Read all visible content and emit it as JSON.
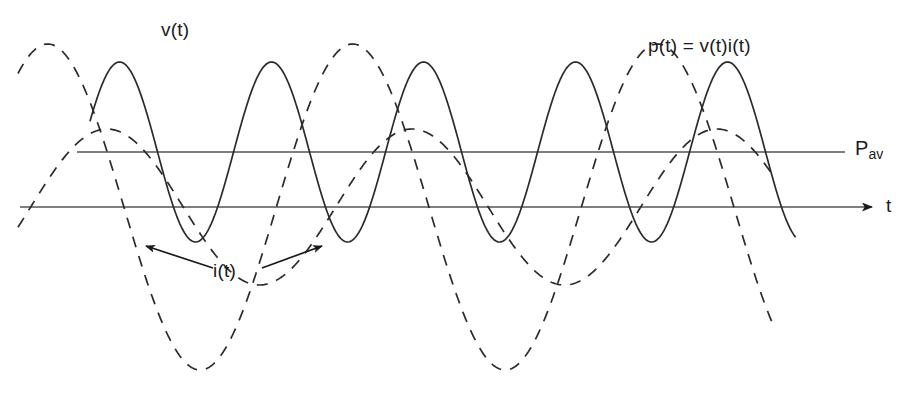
{
  "figure": {
    "title": "",
    "background_color": "#ffffff",
    "curve_color": "#2b2b2b",
    "axis_color": "#555555",
    "text_color": "#1a1a1a",
    "width": 912,
    "height": 394
  },
  "labels": {
    "voltage": "v(t)",
    "power": "p(t) = v(t)i(t)",
    "current": "i(t)",
    "time_axis": "t",
    "average_power_base": "P",
    "average_power_sub": "av"
  },
  "chart_data": {
    "type": "line",
    "title": "",
    "xlabel": "t",
    "ylabel": "",
    "grid": false,
    "legend": "annotations",
    "axes": {
      "time_axis_label": "t",
      "time_axis_y_px": 207,
      "time_axis_x_start_px": 20,
      "time_axis_x_end_px": 878,
      "time_axis_has_arrow": true,
      "pav_line_label": "Pav",
      "pav_line_y_px": 152,
      "pav_line_x_start_px": 77,
      "pav_line_x_end_px": 845
    },
    "annotations": [
      {
        "text": "v(t)",
        "x_px": 178,
        "y_px": 30,
        "points_to": "dashed-voltage-curve"
      },
      {
        "text": "p(t) = v(t)i(t)",
        "x_px": 707,
        "y_px": 47,
        "points_to": "solid-power-curve"
      },
      {
        "text": "i(t)",
        "x_px": 228,
        "y_px": 272,
        "points_to": "dashed-current-curve"
      },
      {
        "text": "t",
        "x_px": 890,
        "y_px": 205,
        "points_to": "time-axis"
      },
      {
        "text": "Pav",
        "x_px": 866,
        "y_px": 148,
        "points_to": "average-power-line"
      }
    ],
    "leader_arrows": [
      {
        "from_x_px": 213,
        "from_y_px": 268,
        "to_x_px": 141,
        "to_y_px": 243
      },
      {
        "from_x_px": 262,
        "from_y_px": 268,
        "to_x_px": 327,
        "to_y_px": 243
      }
    ],
    "series": [
      {
        "name": "v(t)",
        "style": "dashed",
        "description": "Sinusoidal voltage waveform, large amplitude, zero-mean about the t axis",
        "amplitude_px": 163,
        "baseline_y_px": 207,
        "period_px": 305,
        "phase_deg": 55,
        "x_start_px": 18,
        "x_end_px": 772
      },
      {
        "name": "i(t)",
        "style": "dashed",
        "description": "Sinusoidal current waveform, smaller amplitude, lagging the voltage, zero-mean about the t axis",
        "amplitude_px": 78,
        "baseline_y_px": 207,
        "period_px": 305,
        "phase_deg": -15,
        "x_start_px": 18,
        "x_end_px": 772
      },
      {
        "name": "p(t) = v(t)i(t)",
        "style": "solid",
        "description": "Instantaneous power, double frequency sinusoid oscillating about the average power level Pav",
        "amplitude_px": 90,
        "baseline_y_px": 152,
        "period_px": 152,
        "phase_deg": 20,
        "x_start_px": 90,
        "x_end_px": 796
      }
    ]
  }
}
